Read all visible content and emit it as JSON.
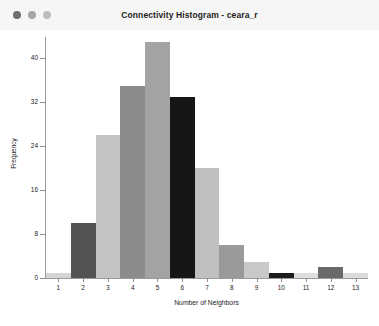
{
  "window": {
    "title": "Connectivity Histogram - ceara_r",
    "controls": [
      {
        "name": "close",
        "color": "#6d6d6d"
      },
      {
        "name": "minimize",
        "color": "#a5a5a5"
      },
      {
        "name": "zoom",
        "color": "#bdbdbd"
      }
    ]
  },
  "chart_data": {
    "type": "bar",
    "title": "Connectivity Histogram - ceara_r",
    "xlabel": "Number of Neighbors",
    "ylabel": "Frequency",
    "categories": [
      "1",
      "2",
      "3",
      "4",
      "5",
      "6",
      "7",
      "8",
      "9",
      "10",
      "11",
      "12",
      "13"
    ],
    "values": [
      1,
      10,
      26,
      35,
      43,
      33,
      20,
      6,
      3,
      1,
      1,
      2,
      1
    ],
    "bar_colors": [
      "#d4d4d4",
      "#535353",
      "#c3c3c3",
      "#8c8c8c",
      "#a3a3a3",
      "#161616",
      "#c0c0c0",
      "#9a9a9a",
      "#c9c9c9",
      "#1c1c1c",
      "#dedede",
      "#6a6a6a",
      "#dcdcdc"
    ],
    "ylim": [
      0,
      45
    ],
    "yticks": [
      "0",
      "8",
      "16",
      "24",
      "32",
      "40"
    ],
    "ytick_values": [
      0,
      8,
      16,
      24,
      32,
      40
    ],
    "grid": false,
    "legend": "none"
  }
}
